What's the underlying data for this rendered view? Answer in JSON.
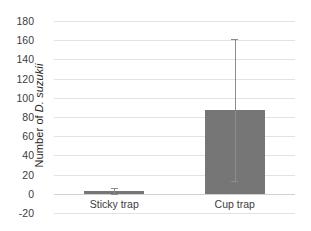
{
  "chart_data": {
    "type": "bar",
    "title": "",
    "xlabel": "",
    "ylabel_prefix": "Number of",
    "ylabel_species": "D. suzukii",
    "categories": [
      "Sticky trap",
      "Cup trap"
    ],
    "values": [
      2.5,
      87
    ],
    "error_low": [
      0,
      13
    ],
    "error_high": [
      6,
      161
    ],
    "ylim": [
      -20,
      180
    ],
    "yticks": [
      180,
      160,
      140,
      120,
      100,
      80,
      60,
      40,
      20,
      0,
      -20
    ],
    "ytick_labels": [
      "180",
      "160",
      "140",
      "120",
      "100",
      "80",
      "60",
      "40",
      "20",
      "0",
      "-20"
    ],
    "grid": true,
    "legend": "none",
    "bar_color": "#767676",
    "gridline_color": "#e3e3e3",
    "background_color": "#ffffff"
  }
}
